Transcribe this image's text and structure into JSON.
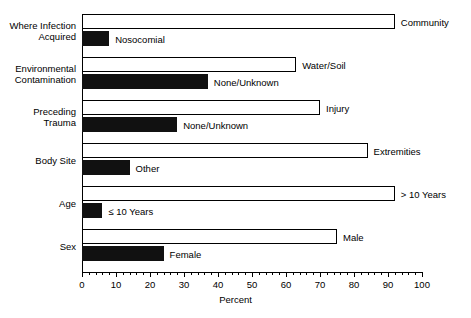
{
  "chart_data": {
    "type": "bar",
    "orientation": "horizontal",
    "title": "",
    "xlabel": "Percent",
    "ylabel": "",
    "xlim": [
      0,
      100
    ],
    "xticks": [
      0,
      10,
      20,
      30,
      40,
      50,
      60,
      70,
      80,
      90,
      100
    ],
    "xtick_labels": [
      "0",
      "10",
      "20",
      "30",
      "40",
      "50",
      "60",
      "70",
      "80",
      "90",
      "100"
    ],
    "minor_tick_step": 2,
    "grid": false,
    "legend": "none",
    "bar_styles": {
      "open": {
        "fill": "#ffffff",
        "edge": "#000000"
      },
      "filled": {
        "fill": "#111111",
        "edge": "#111111"
      }
    },
    "categories": [
      "Where Infection Acquired",
      "Environmental Contamination",
      "Preceding Trauma",
      "Body Site",
      "Age",
      "Sex"
    ],
    "groups": [
      {
        "label": "Where Infection\nAcquired",
        "label_line1": "Where Infection",
        "label_line2": "Acquired",
        "bars": [
          {
            "name": "Community",
            "value": 92,
            "style": "open"
          },
          {
            "name": "Nosocomial",
            "value": 8,
            "style": "filled"
          }
        ]
      },
      {
        "label": "Environmental\nContamination",
        "label_line1": "Environmental",
        "label_line2": "Contamination",
        "bars": [
          {
            "name": "Water/Soil",
            "value": 63,
            "style": "open"
          },
          {
            "name": "None/Unknown",
            "value": 37,
            "style": "filled"
          }
        ]
      },
      {
        "label": "Preceding\nTrauma",
        "label_line1": "Preceding",
        "label_line2": "Trauma",
        "bars": [
          {
            "name": "Injury",
            "value": 70,
            "style": "open"
          },
          {
            "name": "None/Unknown",
            "value": 28,
            "style": "filled"
          }
        ]
      },
      {
        "label": "Body Site",
        "label_line1": "Body Site",
        "label_line2": "",
        "bars": [
          {
            "name": "Extremities",
            "value": 84,
            "style": "open"
          },
          {
            "name": "Other",
            "value": 14,
            "style": "filled"
          }
        ]
      },
      {
        "label": "Age",
        "label_line1": "Age",
        "label_line2": "",
        "bars": [
          {
            "name": "> 10 Years",
            "value": 92,
            "style": "open"
          },
          {
            "name": "≤ 10 Years",
            "value": 6,
            "style": "filled"
          }
        ]
      },
      {
        "label": "Sex",
        "label_line1": "Sex",
        "label_line2": "",
        "bars": [
          {
            "name": "Male",
            "value": 75,
            "style": "open"
          },
          {
            "name": "Female",
            "value": 24,
            "style": "filled"
          }
        ]
      }
    ]
  }
}
